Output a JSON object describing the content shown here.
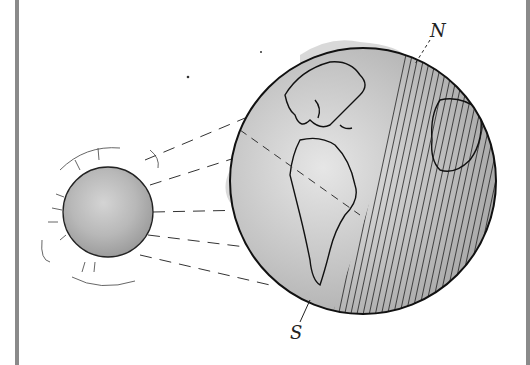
{
  "illustration": {
    "subject": "Sun illuminating Earth",
    "sun": {
      "label": "sun",
      "center": [
        108,
        212
      ],
      "radius": 45
    },
    "earth": {
      "label": "earth",
      "center": [
        363,
        181
      ],
      "radius": 133
    },
    "labels": {
      "north": "N",
      "south": "S"
    }
  },
  "colors": {
    "frame": "#8a8a8a",
    "outline": "#111111",
    "wash_light": "#d9d9d9",
    "wash_dark": "#9a9a9a"
  }
}
